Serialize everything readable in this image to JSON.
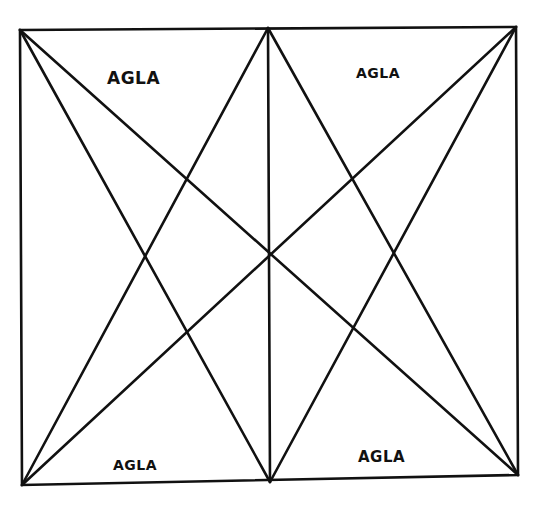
{
  "diagram": {
    "type": "geometric-talisman",
    "labels": {
      "top_left": "AGLA",
      "top_right": "AGLA",
      "bottom_left": "AGLA",
      "bottom_right": "AGLA"
    },
    "colors": {
      "stroke": "#111111",
      "background": "#ffffff"
    }
  }
}
